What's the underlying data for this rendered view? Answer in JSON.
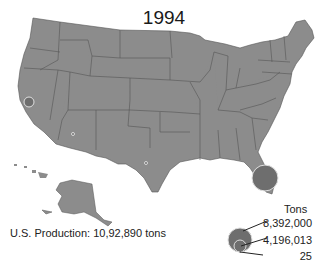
{
  "map": {
    "title": "1994",
    "fill_color": "#8c8c8c",
    "border_color": "#555555",
    "bubble_color": "#6e6e6e",
    "bubbles": [
      {
        "state": "Florida",
        "cx": 265,
        "cy": 178,
        "r": 13
      },
      {
        "state": "California",
        "cx": 29,
        "cy": 102,
        "r": 5
      },
      {
        "state": "Arizona",
        "cx": 73,
        "cy": 134,
        "r": 1.5
      },
      {
        "state": "Texas",
        "cx": 146,
        "cy": 163,
        "r": 1.5
      }
    ]
  },
  "production": {
    "label": "U.S. Production: 10,92,890 tons"
  },
  "legend": {
    "title": "Tons",
    "items": [
      {
        "label": "8,392,000"
      },
      {
        "label": "4,196,013"
      },
      {
        "label": "25"
      }
    ]
  }
}
